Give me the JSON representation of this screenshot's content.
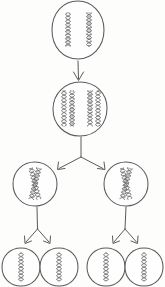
{
  "figure": {
    "background_color": "#fdfdfc",
    "ink_color": "#5a5a5a",
    "chromosome_color": "#6b6b6b",
    "width": 165,
    "height": 287
  },
  "stages": [
    {
      "id": "stage-1",
      "name": "parent-cell",
      "label": "",
      "cells": [
        {
          "id": "cell-parent",
          "cx": 78,
          "cy": 30,
          "rx": 26,
          "ry": 29,
          "chromosome_style": "single-helix",
          "chromosome_count": 2,
          "chromosomes": [
            {
              "x": 68,
              "y": 30,
              "length": 34,
              "tilt": 0
            },
            {
              "x": 89,
              "y": 30,
              "length": 34,
              "tilt": 0
            }
          ]
        }
      ]
    },
    {
      "id": "stage-2",
      "name": "replicated-cell",
      "label": "",
      "cells": [
        {
          "id": "cell-replicated",
          "cx": 80,
          "cy": 109,
          "rx": 27,
          "ry": 27,
          "chromosome_style": "paired-helix",
          "chromosome_count": 4,
          "chromosomes": [
            {
              "x": 64,
              "y": 109,
              "length": 36,
              "tilt": 0
            },
            {
              "x": 72,
              "y": 109,
              "length": 36,
              "tilt": 0
            },
            {
              "x": 90,
              "y": 109,
              "length": 36,
              "tilt": 0
            },
            {
              "x": 98,
              "y": 109,
              "length": 36,
              "tilt": 0
            }
          ]
        }
      ]
    },
    {
      "id": "stage-3",
      "name": "daughter-cells-first-division",
      "label": "",
      "cells": [
        {
          "id": "cell-daughter-left",
          "cx": 35,
          "cy": 184,
          "rx": 22,
          "ry": 22,
          "chromosome_style": "crossed-x",
          "chromosome_count": 2,
          "chromosomes": [
            {
              "x": 35,
              "y": 184,
              "length": 32,
              "tilt": 14
            },
            {
              "x": 35,
              "y": 184,
              "length": 32,
              "tilt": -14
            }
          ]
        },
        {
          "id": "cell-daughter-right",
          "cx": 126,
          "cy": 184,
          "rx": 22,
          "ry": 22,
          "chromosome_style": "crossed-x",
          "chromosome_count": 2,
          "chromosomes": [
            {
              "x": 126,
              "y": 184,
              "length": 32,
              "tilt": 14
            },
            {
              "x": 126,
              "y": 184,
              "length": 32,
              "tilt": -14
            }
          ]
        }
      ]
    },
    {
      "id": "stage-4",
      "name": "gamete-cells-second-division",
      "label": "",
      "cells": [
        {
          "id": "cell-gamete-1",
          "cx": 21,
          "cy": 267,
          "rx": 19,
          "ry": 19,
          "chromosome_style": "single-helix",
          "chromosome_count": 1,
          "chromosomes": [
            {
              "x": 21,
              "y": 267,
              "length": 28,
              "tilt": 0
            }
          ]
        },
        {
          "id": "cell-gamete-2",
          "cx": 59,
          "cy": 267,
          "rx": 19,
          "ry": 19,
          "chromosome_style": "single-helix",
          "chromosome_count": 1,
          "chromosomes": [
            {
              "x": 59,
              "y": 267,
              "length": 28,
              "tilt": 0
            }
          ]
        },
        {
          "id": "cell-gamete-3",
          "cx": 106,
          "cy": 267,
          "rx": 19,
          "ry": 19,
          "chromosome_style": "single-helix",
          "chromosome_count": 1,
          "chromosomes": [
            {
              "x": 106,
              "y": 267,
              "length": 28,
              "tilt": 0
            }
          ]
        },
        {
          "id": "cell-gamete-4",
          "cx": 144,
          "cy": 267,
          "rx": 19,
          "ry": 19,
          "chromosome_style": "single-helix",
          "chromosome_count": 1,
          "chromosomes": [
            {
              "x": 144,
              "y": 267,
              "length": 28,
              "tilt": 0
            }
          ]
        }
      ]
    }
  ],
  "connectors": [
    {
      "id": "arrow-parent-to-replicated",
      "type": "straight-arrow",
      "from": "cell-parent",
      "to": "cell-replicated",
      "x1": 78,
      "y1": 60,
      "x2": 78,
      "y2": 80
    },
    {
      "id": "branch-replicated-to-daughters",
      "type": "y-branch-arrow",
      "from": "cell-replicated",
      "to": [
        "cell-daughter-left",
        "cell-daughter-right"
      ],
      "stem_x": 81,
      "stem_y1": 137,
      "stem_y2": 157,
      "left_end_x": 58,
      "left_end_y": 169,
      "right_end_x": 104,
      "right_end_y": 169
    },
    {
      "id": "branch-daughter-left-to-gametes",
      "type": "y-branch-arrow",
      "from": "cell-daughter-left",
      "to": [
        "cell-gamete-1",
        "cell-gamete-2"
      ],
      "stem_x": 37,
      "stem_y1": 207,
      "stem_y2": 228,
      "left_end_x": 25,
      "left_end_y": 243,
      "right_end_x": 50,
      "right_end_y": 243
    },
    {
      "id": "branch-daughter-right-to-gametes",
      "type": "y-branch-arrow",
      "from": "cell-daughter-right",
      "to": [
        "cell-gamete-3",
        "cell-gamete-4"
      ],
      "stem_x": 126,
      "stem_y1": 207,
      "stem_y2": 228,
      "left_end_x": 113,
      "left_end_y": 243,
      "right_end_x": 137,
      "right_end_y": 243
    }
  ]
}
